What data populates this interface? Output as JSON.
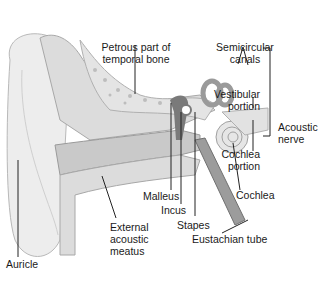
{
  "diagram": {
    "colors": {
      "background": "#ffffff",
      "skin": "#ededed",
      "skin_outline": "#b9b9b9",
      "bone": "#dcdcdc",
      "bone_dark": "#a8a8a8",
      "canal": "#c9c9c9",
      "ossicles": "#7a7a7a",
      "leader_line": "#222222"
    },
    "labels": {
      "petrous": {
        "line1": "Petrous part of",
        "line2": "temporal bone"
      },
      "semicircular": {
        "line1": "Semicircular",
        "line2": "canals"
      },
      "vestibular": {
        "line1": "Vestibular",
        "line2": "portion"
      },
      "acoustic_nerve": {
        "line1": "Acoustic",
        "line2": "nerve"
      },
      "cochlea_portion": {
        "line1": "Cochlea",
        "line2": "portion"
      },
      "cochlea": "Cochlea",
      "malleus": "Malleus",
      "incus": "Incus",
      "stapes": "Stapes",
      "eustachian": "Eustachian tube",
      "external_meatus": {
        "line1": "External",
        "line2": "acoustic",
        "line3": "meatus"
      },
      "auricle": "Auricle"
    }
  }
}
